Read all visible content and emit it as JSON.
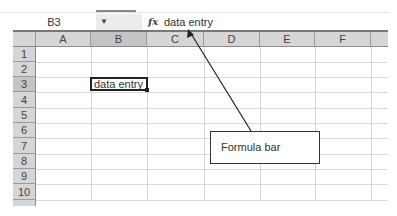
{
  "formula_bar": {
    "name_box": "B3",
    "dropdown_icon": "chevron-down-icon",
    "fx_label": "fx",
    "content": "data entry"
  },
  "columns": [
    "A",
    "B",
    "C",
    "D",
    "E",
    "F"
  ],
  "rows": [
    "1",
    "2",
    "3",
    "4",
    "5",
    "6",
    "7",
    "8",
    "9",
    "10"
  ],
  "active_cell": {
    "ref": "B3",
    "value": "data entry"
  },
  "annotation": {
    "label": "Formula bar",
    "arrow_icon": "arrow-icon"
  },
  "colors": {
    "header_bg": "#d6d6d6",
    "selected_header_bg": "#c4c4c4",
    "gridline": "#d4d4d4",
    "active_border": "#222222"
  }
}
